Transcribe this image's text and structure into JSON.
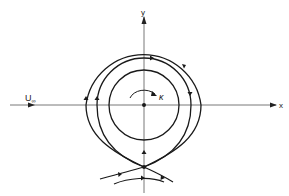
{
  "figure": {
    "labels": {
      "x_axis": "x",
      "y_axis": "y",
      "free_stream": "U",
      "free_stream_subscript": "∞",
      "circulation": "κ"
    },
    "colors": {
      "line": "#1a1a1a",
      "axis": "#555555",
      "background": "#ffffff"
    },
    "elements": [
      "x-axis with arrow",
      "y-axis with arrow",
      "inner closed streamline circle",
      "middle streamline (pinched, with arrows)",
      "outer streamline (pinched, with arrows)",
      "stagnation point below center",
      "external streamlines crossing below",
      "vortex rotation arrow (clockwise)",
      "center point"
    ]
  }
}
